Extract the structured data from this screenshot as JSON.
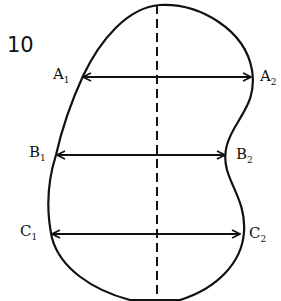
{
  "figure": {
    "number": "10",
    "stroke_color": "#111111",
    "background": "#ffffff"
  },
  "axis": {
    "style": "dashed",
    "orientation": "vertical"
  },
  "measurements": [
    {
      "name": "A",
      "left_label": "A",
      "left_sub": "1",
      "right_label": "A",
      "right_sub": "2"
    },
    {
      "name": "B",
      "left_label": "B",
      "left_sub": "1",
      "right_label": "B",
      "right_sub": "2"
    },
    {
      "name": "C",
      "left_label": "C",
      "left_sub": "1",
      "right_label": "C",
      "right_sub": "2"
    }
  ]
}
